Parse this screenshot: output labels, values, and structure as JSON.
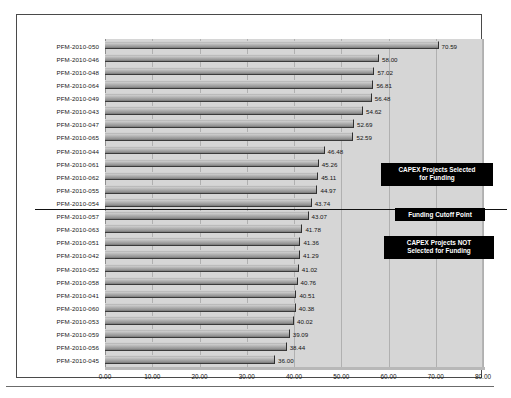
{
  "chart_data": {
    "type": "bar",
    "orientation": "horizontal",
    "title": "",
    "xlabel": "",
    "ylabel": "",
    "xlim": [
      0,
      80
    ],
    "xticks": [
      "0.00",
      "10.00",
      "20.00",
      "30.00",
      "40.00",
      "50.00",
      "60.00",
      "70.00",
      "80.00"
    ],
    "xtick_values": [
      0,
      10,
      20,
      30,
      40,
      50,
      60,
      70,
      80
    ],
    "grid": "vertical",
    "legend": "none",
    "categories": [
      "PFM-2010-050",
      "PFM-2010-046",
      "PFM-2010-048",
      "PFM-2010-064",
      "PFM-2010-049",
      "PFM-2010-043",
      "PFM-2010-047",
      "PFM-2010-065",
      "PFM-2010-044",
      "PFM-2010-061",
      "PFM-2010-062",
      "PFM-2010-055",
      "PFM-2010-054",
      "PFM-2010-057",
      "PFM-2010-063",
      "PFM-2010-051",
      "PFM-2010-042",
      "PFM-2010-052",
      "PFM-2010-058",
      "PFM-2010-041",
      "PFM-2010-060",
      "PFM-2010-053",
      "PFM-2010-059",
      "PFM-2010-056",
      "PFM-2010-045"
    ],
    "values": [
      70.59,
      58.0,
      57.02,
      56.81,
      56.48,
      54.62,
      52.69,
      52.59,
      46.48,
      45.26,
      45.11,
      44.97,
      43.74,
      43.07,
      41.78,
      41.36,
      41.29,
      41.02,
      40.76,
      40.51,
      40.38,
      40.02,
      39.09,
      38.44,
      36.0
    ],
    "value_labels": [
      "70.59",
      "58.00",
      "57.02",
      "56.81",
      "56.48",
      "54.62",
      "52.69",
      "52.59",
      "46.48",
      "45.26",
      "45.11",
      "44.97",
      "43.74",
      "43.07",
      "41.78",
      "41.36",
      "41.29",
      "41.02",
      "40.76",
      "40.51",
      "40.38",
      "40.02",
      "39.09",
      "38.44",
      "36.00"
    ],
    "cutoff_after_index": 12,
    "annotations": [
      {
        "id": "selected",
        "text": "CAPEX Projects Selected\nfor Funding"
      },
      {
        "id": "cutoff",
        "text": "Funding Cutoff Point"
      },
      {
        "id": "notselected",
        "text": "CAPEX Projects NOT\nSelected for Funding"
      }
    ],
    "colors": {
      "plot_background": "#d6d6d6",
      "bar_fill": "#a8a8a8",
      "bar_edge": "#2e2e2e",
      "gridline": "#b0b0b0",
      "callout_background": "#000000",
      "callout_text": "#ffffff",
      "cutoff_line": "#111111",
      "frame": "#4a4a4a"
    }
  }
}
